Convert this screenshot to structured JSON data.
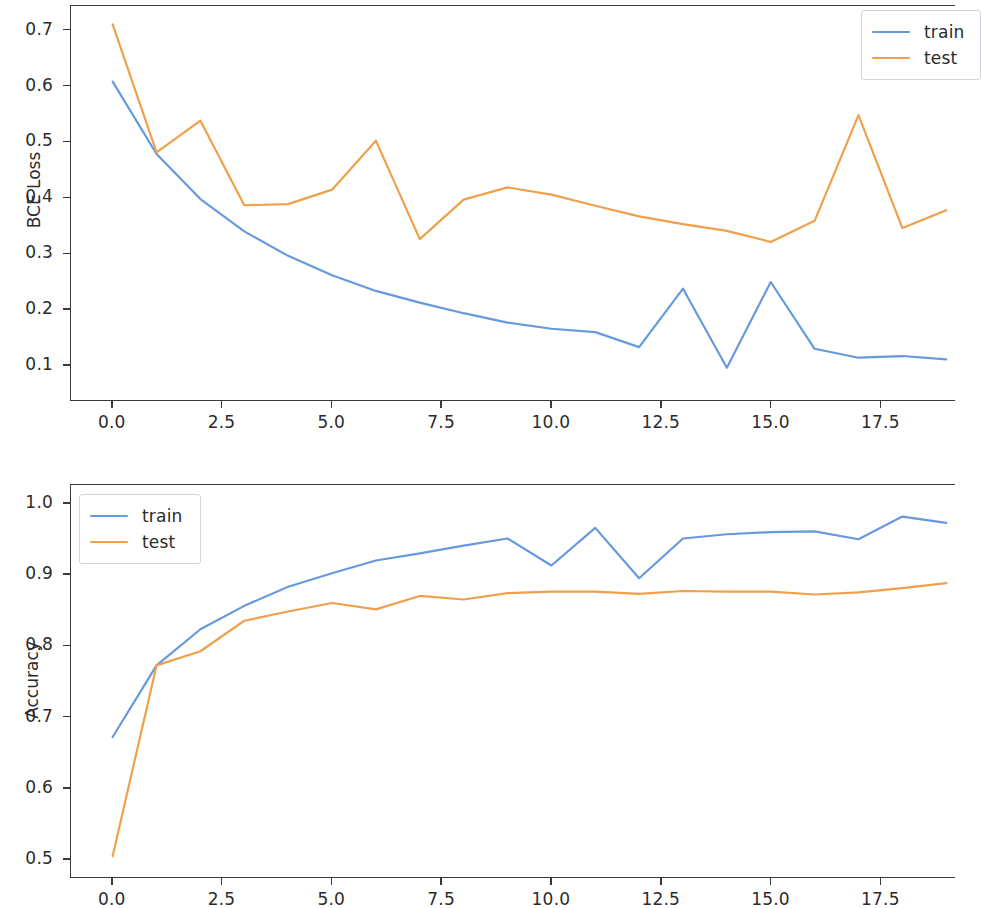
{
  "figure": {
    "background": "#ffffff",
    "panels": [
      "loss",
      "accuracy"
    ]
  },
  "colors": {
    "train": "#6699dd",
    "test": "#f0a04b",
    "axis": "#3a3a3a",
    "text": "#2b2b2b",
    "legend_border": "#d4d4d8"
  },
  "legend": {
    "train_label": "train",
    "test_label": "test"
  },
  "loss_panel": {
    "ylabel": "BCE Loss",
    "yticks": [
      "0.1",
      "0.2",
      "0.3",
      "0.4",
      "0.5",
      "0.6",
      "0.7"
    ],
    "xticks": [
      "0.0",
      "2.5",
      "5.0",
      "7.5",
      "10.0",
      "12.5",
      "15.0",
      "17.5"
    ]
  },
  "accuracy_panel": {
    "ylabel": "Accuracy",
    "yticks": [
      "0.5",
      "0.6",
      "0.7",
      "0.8",
      "0.9",
      "1.0"
    ],
    "xticks": [
      "0.0",
      "2.5",
      "5.0",
      "7.5",
      "10.0",
      "12.5",
      "15.0",
      "17.5"
    ]
  },
  "chart_data": [
    {
      "type": "line",
      "title": "",
      "xlabel": "",
      "ylabel": "BCE Loss",
      "grid": false,
      "legend_position": "upper right",
      "xlim": [
        -0.95,
        19.2
      ],
      "ylim": [
        0.036,
        0.744
      ],
      "xticks": [
        0.0,
        2.5,
        5.0,
        7.5,
        10.0,
        12.5,
        15.0,
        17.5
      ],
      "yticks": [
        0.1,
        0.2,
        0.3,
        0.4,
        0.5,
        0.6,
        0.7
      ],
      "x": [
        0,
        1,
        2,
        3,
        4,
        5,
        6,
        7,
        8,
        9,
        10,
        11,
        12,
        13,
        14,
        15,
        16,
        17,
        18,
        19
      ],
      "series": [
        {
          "name": "train",
          "color": "#6699dd",
          "values": [
            0.608,
            0.478,
            0.397,
            0.339,
            0.295,
            0.26,
            0.232,
            0.211,
            0.192,
            0.175,
            0.164,
            0.158,
            0.131,
            0.236,
            0.094,
            0.248,
            0.128,
            0.112,
            0.115,
            0.109
          ]
        },
        {
          "name": "test",
          "color": "#f0a04b",
          "values": [
            0.711,
            0.481,
            0.538,
            0.386,
            0.388,
            0.414,
            0.502,
            0.325,
            0.396,
            0.418,
            0.405,
            0.385,
            0.366,
            0.352,
            0.34,
            0.32,
            0.358,
            0.548,
            0.345,
            0.377
          ]
        }
      ]
    },
    {
      "type": "line",
      "title": "",
      "xlabel": "",
      "ylabel": "Accuracy",
      "grid": false,
      "legend_position": "upper left",
      "xlim": [
        -0.95,
        19.2
      ],
      "ylim": [
        0.4735,
        1.0265
      ],
      "xticks": [
        0.0,
        2.5,
        5.0,
        7.5,
        10.0,
        12.5,
        15.0,
        17.5
      ],
      "yticks": [
        0.5,
        0.6,
        0.7,
        0.8,
        0.9,
        1.0
      ],
      "x": [
        0,
        1,
        2,
        3,
        4,
        5,
        6,
        7,
        8,
        9,
        10,
        11,
        12,
        13,
        14,
        15,
        16,
        17,
        18,
        19
      ],
      "series": [
        {
          "name": "train",
          "color": "#6699dd",
          "values": [
            0.671,
            0.772,
            0.823,
            0.856,
            0.883,
            0.902,
            0.92,
            0.93,
            0.941,
            0.951,
            0.913,
            0.966,
            0.895,
            0.951,
            0.957,
            0.96,
            0.961,
            0.95,
            0.982,
            0.973
          ]
        },
        {
          "name": "test",
          "color": "#f0a04b",
          "values": [
            0.503,
            0.772,
            0.792,
            0.835,
            0.848,
            0.86,
            0.851,
            0.87,
            0.865,
            0.874,
            0.876,
            0.876,
            0.873,
            0.877,
            0.876,
            0.876,
            0.872,
            0.875,
            0.881,
            0.888
          ]
        }
      ]
    }
  ]
}
